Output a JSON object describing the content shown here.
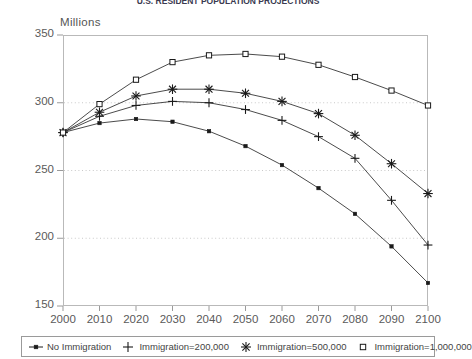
{
  "title": "U.S. RESIDENT POPULATION PROJECTIONS",
  "axis": {
    "y_label": "Millions",
    "y_ticks": [
      "350",
      "300",
      "250",
      "200",
      "150"
    ],
    "x_ticks": [
      "2000",
      "2010",
      "2020",
      "2030",
      "2040",
      "2050",
      "2060",
      "2070",
      "2080",
      "2090",
      "2100"
    ]
  },
  "legend": {
    "items": [
      {
        "label": "No Immigration",
        "marker": "filled-square-line-marker",
        "color": "#1a1a1a"
      },
      {
        "label": "Immigration=200,000",
        "marker": "plus-marker",
        "color": "#1a1a1a"
      },
      {
        "label": "Immigration=500,000",
        "marker": "asterisk-star-marker",
        "color": "#1a1a1a"
      },
      {
        "label": "Immigration=1,000,000",
        "marker": "open-square-marker",
        "color": "#1a1a1a"
      }
    ]
  },
  "chart_data": {
    "type": "line",
    "title": "U.S. RESIDENT POPULATION PROJECTIONS",
    "xlabel": "",
    "ylabel": "Millions",
    "x": [
      2000,
      2010,
      2020,
      2030,
      2040,
      2050,
      2060,
      2070,
      2080,
      2090,
      2100
    ],
    "xlim": [
      2000,
      2100
    ],
    "ylim": [
      150,
      350
    ],
    "grid": "horizontal-dotted",
    "legend_position": "bottom",
    "series": [
      {
        "name": "No Immigration",
        "marker": "filled-square",
        "values": [
          278,
          285,
          288,
          286,
          279,
          268,
          254,
          237,
          218,
          194,
          167
        ]
      },
      {
        "name": "Immigration=200,000",
        "marker": "plus",
        "values": [
          278,
          290,
          298,
          301,
          300,
          295,
          287,
          275,
          259,
          228,
          195
        ]
      },
      {
        "name": "Immigration=500,000",
        "marker": "asterisk",
        "values": [
          278,
          293,
          305,
          310,
          310,
          307,
          301,
          292,
          276,
          255,
          233
        ]
      },
      {
        "name": "Immigration=1,000,000",
        "marker": "open-square",
        "values": [
          278,
          299,
          317,
          330,
          335,
          336,
          334,
          328,
          319,
          309,
          298
        ]
      }
    ]
  }
}
